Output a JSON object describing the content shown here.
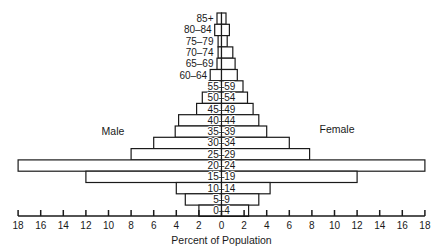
{
  "chart_data": {
    "type": "bar",
    "subtype": "population-pyramid",
    "title": "",
    "xlabel": "Percent of Population",
    "ylabel": "",
    "left_label": "Male",
    "right_label": "Female",
    "xlim": [
      -18,
      18
    ],
    "x_ticks": [
      18,
      16,
      14,
      12,
      10,
      8,
      6,
      4,
      2,
      0,
      2,
      4,
      6,
      8,
      10,
      12,
      14,
      16,
      18
    ],
    "grid": false,
    "legend": "none",
    "categories": [
      "85+",
      "80–84",
      "75–79",
      "70–74",
      "65–69",
      "60–64",
      "55–59",
      "50–54",
      "45–49",
      "40–44",
      "35–39",
      "30–34",
      "25–29",
      "20–24",
      "15–19",
      "10–14",
      "5–9",
      "0–4"
    ],
    "series": [
      {
        "name": "Male",
        "values": [
          0.4,
          0.6,
          0.3,
          0.3,
          0.4,
          1.0,
          1.1,
          1.7,
          2.2,
          3.8,
          4.1,
          6.0,
          8.0,
          18.0,
          12.0,
          4.0,
          3.2,
          2.0
        ]
      },
      {
        "name": "Female",
        "values": [
          0.4,
          0.7,
          0.5,
          1.0,
          1.2,
          1.4,
          1.9,
          2.3,
          2.8,
          3.3,
          4.0,
          6.0,
          7.8,
          18.0,
          12.0,
          4.3,
          3.3,
          2.4
        ]
      }
    ]
  },
  "layout": {
    "center_x": 221.5,
    "px_per_unit": 11.3,
    "top_y": 13,
    "row_h": 11.3,
    "axis_y": 216
  }
}
